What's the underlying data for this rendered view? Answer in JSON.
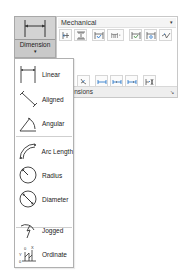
{
  "ribbon": {
    "style_select": {
      "value": "Mechanical",
      "arrow": "▾"
    },
    "row1_tools": [
      {
        "name": "baseline-icon"
      },
      {
        "name": "continue-icon"
      },
      {
        "name": "inspection-icon"
      },
      {
        "name": "dimension-break-dropdown-icon",
        "has_dropdown": true
      },
      {
        "name": "adjust-space-icon"
      },
      {
        "name": "reassociate-icon"
      },
      {
        "name": "jog-line-icon"
      }
    ],
    "row2_tools": [
      {
        "name": "oblique-icon"
      },
      {
        "name": "text-angle-left-icon"
      },
      {
        "name": "text-angle-center-icon"
      },
      {
        "name": "text-angle-right-icon"
      },
      {
        "name": "override-icon"
      }
    ],
    "footer": {
      "label": "Dimensions",
      "launcher": "↘"
    }
  },
  "dimension_button": {
    "label": "Dimension",
    "caret": "▾",
    "icon": "linear-dimension-icon"
  },
  "menu": {
    "items": [
      {
        "label": "Linear",
        "icon": "linear-icon"
      },
      {
        "label": "Aligned",
        "icon": "aligned-icon"
      },
      {
        "label": "Angular",
        "icon": "angular-icon"
      },
      {
        "label": "Arc Length",
        "icon": "arc-length-icon"
      },
      {
        "label": "Radius",
        "icon": "radius-icon"
      },
      {
        "label": "Diameter",
        "icon": "diameter-icon"
      },
      {
        "label": "Jogged",
        "icon": "jogged-icon"
      },
      {
        "label": "Ordinate",
        "icon": "ordinate-icon"
      }
    ]
  }
}
